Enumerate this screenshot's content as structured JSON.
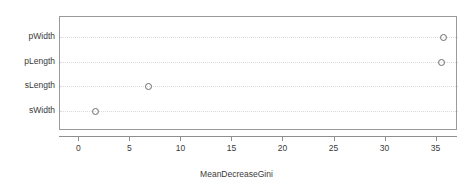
{
  "chart_data": {
    "type": "scatter",
    "subtype": "dotchart",
    "title": "",
    "xlabel": "MeanDecreaseGini",
    "ylabel": "",
    "categories": [
      "pWidth",
      "pLength",
      "sLength",
      "sWidth"
    ],
    "values": [
      35.6,
      35.4,
      6.7,
      1.5
    ],
    "points": [
      {
        "label": "pWidth",
        "value": 35.6
      },
      {
        "label": "pLength",
        "value": 35.4
      },
      {
        "label": "sLength",
        "value": 6.7
      },
      {
        "label": "sWidth",
        "value": 1.5
      }
    ],
    "xlim": [
      -1.9,
      37.1
    ],
    "xticks": [
      0,
      5,
      10,
      15,
      20,
      25,
      30,
      35
    ],
    "xticklabels": [
      "0",
      "5",
      "10",
      "15",
      "20",
      "25",
      "30",
      "35"
    ],
    "grid": true,
    "grid_style": "dotted-horizontal",
    "legend": null,
    "marker": "open-circle",
    "colors": {
      "marker_stroke": "#6b6b6b",
      "box_border": "#9a9a9a",
      "gridline": "#d8d8d8",
      "axis": "#8f8f8f",
      "text": "#3a3a3a",
      "background": "#ffffff"
    }
  }
}
